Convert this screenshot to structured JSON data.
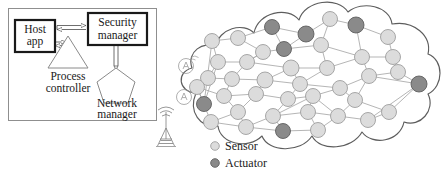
{
  "figure": {
    "panels": [
      "gateway-panel",
      "wireless-mesh-cloud"
    ]
  },
  "left_panel": {
    "border_color": "#8a8a8a",
    "blocks": [
      {
        "id": "host-app",
        "label_line1": "Host",
        "label_line2": "app",
        "shape": "rect-thick",
        "x": 14,
        "y": 20,
        "w": 40,
        "h": 32
      },
      {
        "id": "security-manager",
        "label_line1": "Security",
        "label_line2": "manager",
        "shape": "rect-thick",
        "x": 90,
        "y": 14,
        "w": 54,
        "h": 30
      }
    ],
    "shapes": [
      {
        "id": "process-controller",
        "label_line1": "Process",
        "label_line2": "controller",
        "shape": "triangle",
        "cx": 68,
        "cy": 52
      },
      {
        "id": "network-manager",
        "label_line1": "Network",
        "label_line2": "manager",
        "shape": "pentagon",
        "cx": 116,
        "cy": 82
      }
    ],
    "connectors": [
      {
        "id": "host-to-security",
        "style": "hollow-double-arrow",
        "direction": "bidirectional"
      },
      {
        "id": "host-to-process",
        "style": "hollow-double-arrow",
        "direction": "right"
      },
      {
        "id": "security-to-network",
        "style": "hollow-line",
        "direction": "down"
      }
    ],
    "antenna": {
      "id": "radio-tower",
      "x": 166,
      "y": 112
    }
  },
  "cloud": {
    "id": "wireless-mesh-cloud",
    "stroke": "#5a5a5a",
    "fill": "#ffffff",
    "access_points": [
      {
        "id": "access-point-1",
        "x": 186,
        "y": 66
      },
      {
        "id": "access-point-2",
        "x": 184,
        "y": 97
      }
    ]
  },
  "legend": {
    "items": [
      {
        "id": "legend-sensor",
        "label": "Sensor",
        "color": "#dcdcdc",
        "stroke": "#9a9a9a"
      },
      {
        "id": "legend-actuator",
        "label": "Actuator",
        "color": "#8c8c8c",
        "stroke": "#5f5f5f"
      }
    ]
  },
  "chart_data": {
    "type": "scatter",
    "node_types": {
      "sensor": {
        "fill": "#dcdcdc",
        "stroke": "#9e9e9e",
        "count": 32
      },
      "actuator": {
        "fill": "#8a8a8a",
        "stroke": "#5f5f5f",
        "count": 9
      }
    },
    "nodes": [
      {
        "id": 0,
        "x": 204,
        "y": 104,
        "r": 7.5,
        "type": "actuator"
      },
      {
        "id": 1,
        "x": 212,
        "y": 41,
        "r": 7.5,
        "type": "sensor"
      },
      {
        "id": 2,
        "x": 238,
        "y": 38,
        "r": 7.5,
        "type": "sensor"
      },
      {
        "id": 3,
        "x": 272,
        "y": 27,
        "r": 7.5,
        "type": "actuator"
      },
      {
        "id": 4,
        "x": 306,
        "y": 34,
        "r": 8,
        "type": "actuator"
      },
      {
        "id": 5,
        "x": 330,
        "y": 19,
        "r": 7.5,
        "type": "sensor"
      },
      {
        "id": 6,
        "x": 356,
        "y": 25,
        "r": 8,
        "type": "actuator"
      },
      {
        "id": 7,
        "x": 388,
        "y": 37,
        "r": 7.5,
        "type": "sensor"
      },
      {
        "id": 8,
        "x": 263,
        "y": 52,
        "r": 7.5,
        "type": "sensor"
      },
      {
        "id": 9,
        "x": 284,
        "y": 49,
        "r": 7.5,
        "type": "actuator"
      },
      {
        "id": 10,
        "x": 321,
        "y": 45,
        "r": 7.5,
        "type": "sensor"
      },
      {
        "id": 11,
        "x": 362,
        "y": 57,
        "r": 7.5,
        "type": "sensor"
      },
      {
        "id": 12,
        "x": 393,
        "y": 57,
        "r": 7.5,
        "type": "sensor"
      },
      {
        "id": 13,
        "x": 218,
        "y": 62,
        "r": 7.5,
        "type": "sensor"
      },
      {
        "id": 14,
        "x": 247,
        "y": 62,
        "r": 7.5,
        "type": "sensor"
      },
      {
        "id": 15,
        "x": 291,
        "y": 68,
        "r": 8,
        "type": "sensor"
      },
      {
        "id": 16,
        "x": 327,
        "y": 68,
        "r": 7.5,
        "type": "sensor"
      },
      {
        "id": 17,
        "x": 369,
        "y": 76,
        "r": 7.5,
        "type": "sensor"
      },
      {
        "id": 18,
        "x": 398,
        "y": 72,
        "r": 7.5,
        "type": "sensor"
      },
      {
        "id": 19,
        "x": 208,
        "y": 78,
        "r": 7.5,
        "type": "sensor"
      },
      {
        "id": 20,
        "x": 232,
        "y": 79,
        "r": 7.5,
        "type": "sensor"
      },
      {
        "id": 21,
        "x": 265,
        "y": 80,
        "r": 8,
        "type": "sensor"
      },
      {
        "id": 22,
        "x": 300,
        "y": 84,
        "r": 7.5,
        "type": "sensor"
      },
      {
        "id": 23,
        "x": 340,
        "y": 88,
        "r": 7.5,
        "type": "sensor"
      },
      {
        "id": 24,
        "x": 419,
        "y": 84,
        "r": 8,
        "type": "actuator"
      },
      {
        "id": 25,
        "x": 197,
        "y": 87,
        "r": 7.5,
        "type": "sensor"
      },
      {
        "id": 26,
        "x": 224,
        "y": 96,
        "r": 7.5,
        "type": "sensor"
      },
      {
        "id": 27,
        "x": 256,
        "y": 94,
        "r": 7.5,
        "type": "sensor"
      },
      {
        "id": 28,
        "x": 288,
        "y": 99,
        "r": 7.5,
        "type": "sensor"
      },
      {
        "id": 29,
        "x": 313,
        "y": 96,
        "r": 7.5,
        "type": "sensor"
      },
      {
        "id": 30,
        "x": 355,
        "y": 100,
        "r": 7.5,
        "type": "sensor"
      },
      {
        "id": 31,
        "x": 389,
        "y": 112,
        "r": 7.5,
        "type": "sensor"
      },
      {
        "id": 32,
        "x": 238,
        "y": 112,
        "r": 7.5,
        "type": "sensor"
      },
      {
        "id": 33,
        "x": 273,
        "y": 116,
        "r": 7.5,
        "type": "sensor"
      },
      {
        "id": 34,
        "x": 308,
        "y": 112,
        "r": 7.5,
        "type": "sensor"
      },
      {
        "id": 35,
        "x": 338,
        "y": 116,
        "r": 7.5,
        "type": "sensor"
      },
      {
        "id": 36,
        "x": 211,
        "y": 122,
        "r": 7.5,
        "type": "sensor"
      },
      {
        "id": 37,
        "x": 246,
        "y": 127,
        "r": 7.5,
        "type": "sensor"
      },
      {
        "id": 38,
        "x": 283,
        "y": 131,
        "r": 7.5,
        "type": "actuator"
      },
      {
        "id": 39,
        "x": 318,
        "y": 130,
        "r": 7.5,
        "type": "sensor"
      },
      {
        "id": 40,
        "x": 368,
        "y": 120,
        "r": 7.5,
        "type": "sensor"
      }
    ],
    "edges": [
      [
        1,
        2
      ],
      [
        2,
        3
      ],
      [
        3,
        4
      ],
      [
        4,
        5
      ],
      [
        5,
        6
      ],
      [
        6,
        7
      ],
      [
        2,
        8
      ],
      [
        8,
        9
      ],
      [
        9,
        10
      ],
      [
        10,
        5
      ],
      [
        10,
        11
      ],
      [
        11,
        12
      ],
      [
        12,
        7
      ],
      [
        1,
        13
      ],
      [
        13,
        14
      ],
      [
        14,
        8
      ],
      [
        14,
        15
      ],
      [
        15,
        16
      ],
      [
        16,
        11
      ],
      [
        11,
        17
      ],
      [
        17,
        18
      ],
      [
        12,
        18
      ],
      [
        16,
        10
      ],
      [
        13,
        19
      ],
      [
        19,
        20
      ],
      [
        20,
        14
      ],
      [
        20,
        21
      ],
      [
        21,
        15
      ],
      [
        21,
        22
      ],
      [
        22,
        16
      ],
      [
        22,
        23
      ],
      [
        23,
        17
      ],
      [
        17,
        24
      ],
      [
        18,
        24
      ],
      [
        19,
        25
      ],
      [
        25,
        0
      ],
      [
        0,
        1
      ],
      [
        0,
        13
      ],
      [
        25,
        26
      ],
      [
        26,
        20
      ],
      [
        26,
        27
      ],
      [
        27,
        21
      ],
      [
        27,
        28
      ],
      [
        28,
        22
      ],
      [
        28,
        29
      ],
      [
        29,
        23
      ],
      [
        23,
        30
      ],
      [
        30,
        31
      ],
      [
        31,
        24
      ],
      [
        30,
        17
      ],
      [
        26,
        32
      ],
      [
        32,
        27
      ],
      [
        32,
        36
      ],
      [
        36,
        25
      ],
      [
        32,
        37
      ],
      [
        37,
        33
      ],
      [
        33,
        28
      ],
      [
        33,
        29
      ],
      [
        34,
        29
      ],
      [
        34,
        35
      ],
      [
        35,
        30
      ],
      [
        37,
        38
      ],
      [
        38,
        39
      ],
      [
        39,
        34
      ],
      [
        39,
        35
      ],
      [
        33,
        38
      ],
      [
        34,
        33
      ],
      [
        35,
        40
      ],
      [
        40,
        31
      ],
      [
        36,
        37
      ],
      [
        29,
        35
      ],
      [
        15,
        22
      ],
      [
        8,
        14
      ],
      [
        3,
        9
      ],
      [
        4,
        9
      ],
      [
        6,
        11
      ],
      [
        24,
        40
      ]
    ]
  }
}
